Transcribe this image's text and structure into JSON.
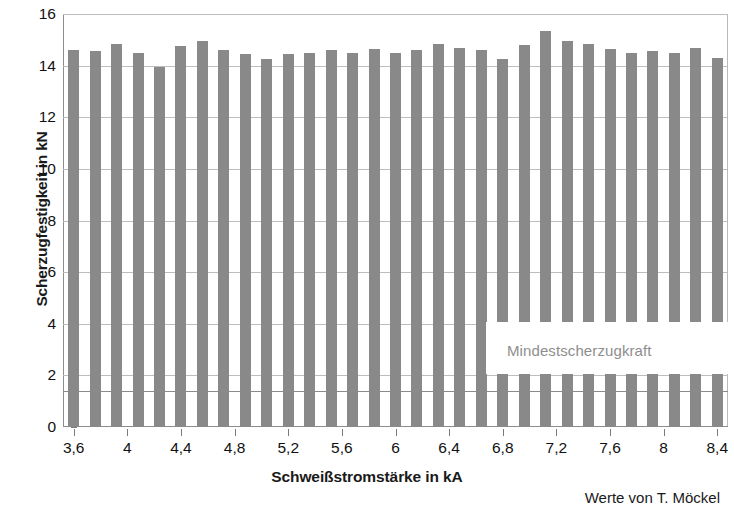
{
  "chart_data": {
    "type": "bar",
    "title": "",
    "xlabel": "Schweißstromstärke in kA",
    "ylabel": "Scherzugfestigkeit in kN",
    "ylim": [
      0,
      16
    ],
    "y_ticks": [
      0,
      2,
      4,
      6,
      8,
      10,
      12,
      14,
      16
    ],
    "y_tick_labels": [
      "0",
      "2",
      "4",
      "6",
      "8",
      "10",
      "12",
      "14",
      "16"
    ],
    "xlim": [
      3.52,
      8.48
    ],
    "x_tick_labels": [
      "3,6",
      "4",
      "4,4",
      "4,8",
      "5,2",
      "5,6",
      "6",
      "6,4",
      "6,8",
      "7,2",
      "7,6",
      "8",
      "8,4"
    ],
    "x_tick_values": [
      3.6,
      4.0,
      4.4,
      4.8,
      5.2,
      5.6,
      6.0,
      6.4,
      6.8,
      7.2,
      7.6,
      8.0,
      8.4
    ],
    "grid": true,
    "legend": "none",
    "bar_color": "#898989",
    "categories": [
      3.6,
      3.76,
      3.92,
      4.08,
      4.24,
      4.4,
      4.56,
      4.72,
      4.88,
      5.04,
      5.2,
      5.36,
      5.52,
      5.68,
      5.84,
      6.0,
      6.16,
      6.32,
      6.48,
      6.64,
      6.8,
      6.96,
      7.12,
      7.28,
      7.44,
      7.6,
      7.76,
      7.92,
      8.08,
      8.24,
      8.4
    ],
    "values": [
      14.6,
      14.55,
      14.85,
      14.5,
      13.95,
      14.75,
      14.95,
      14.6,
      14.45,
      14.25,
      14.45,
      14.5,
      14.6,
      14.5,
      14.65,
      14.5,
      14.6,
      14.85,
      14.7,
      14.6,
      14.25,
      14.8,
      15.35,
      14.95,
      14.85,
      14.65,
      14.5,
      14.55,
      14.5,
      14.7,
      14.3
    ],
    "annotations": [
      {
        "name": "minimum-shear-force-label",
        "text": "Mindestscherzugkraft",
        "color": "#8e8e8e"
      }
    ],
    "reference_lines": [
      {
        "name": "minimum-shear-force-line",
        "value": 1.4,
        "orientation": "horizontal",
        "color": "#8a8a8a"
      }
    ]
  },
  "credit": "Werte von T. Möckel"
}
